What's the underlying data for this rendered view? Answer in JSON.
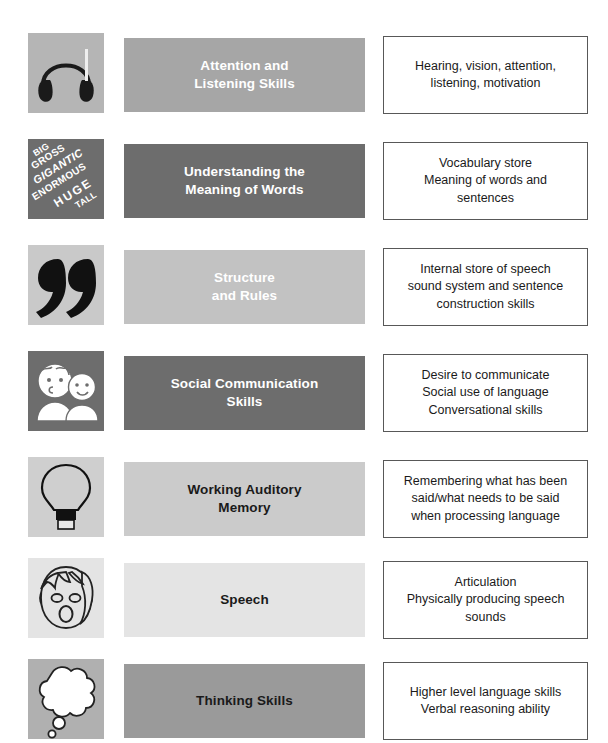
{
  "page": {
    "background_color": "#ffffff"
  },
  "palette": {
    "band_medium_gray": "#a6a6a6",
    "band_dark_gray": "#6d6d6d",
    "band_light_gray": "#c4c4c4",
    "band_lighter_gray": "#cfcfcf",
    "band_very_light_gray": "#e4e4e4",
    "band_mid_gray": "#9a9a9a",
    "icon_tile_light": "#cfcfcf",
    "icon_tile_dark": "#6d6d6d",
    "icon_tile_pale": "#e2e2e2",
    "box_border": "#585858",
    "text_white": "#ffffff",
    "text_dark": "#1a1a1a"
  },
  "rows": [
    {
      "id": "attention-listening",
      "icon_name": "headphones-icon",
      "icon_tile_color": "#b5b5b5",
      "band_color": "#a6a6a6",
      "band_text_color": "#ffffff",
      "label": "Attention and\nListening Skills",
      "description": "Hearing, vision, attention,\nlistening, motivation"
    },
    {
      "id": "meaning-of-words",
      "icon_name": "word-cloud-icon",
      "icon_tile_color": "#6d6d6d",
      "band_color": "#6d6d6d",
      "band_text_color": "#ffffff",
      "label": "Understanding the\nMeaning of Words",
      "description": "Vocabulary store\nMeaning of words and\nsentences",
      "icon_words": [
        "BIG",
        "GROSS",
        "GIGANTIC",
        "ENORMOUS",
        "HUGE",
        "TALL"
      ]
    },
    {
      "id": "structure-and-rules",
      "icon_name": "quotation-marks-icon",
      "icon_tile_color": "#c9c9c9",
      "band_color": "#c2c2c2",
      "band_text_color": "#ffffff",
      "label": "Structure\nand Rules",
      "description": "Internal store of speech\nsound system and sentence\nconstruction skills"
    },
    {
      "id": "social-communication",
      "icon_name": "two-people-icon",
      "icon_tile_color": "#6d6d6d",
      "band_color": "#6d6d6d",
      "band_text_color": "#ffffff",
      "label": "Social Communication\nSkills",
      "description": "Desire to communicate\nSocial use of language\nConversational skills"
    },
    {
      "id": "working-auditory-memory",
      "icon_name": "light-bulb-icon",
      "icon_tile_color": "#cfcfcf",
      "band_color": "#cbcbcb",
      "band_text_color": "#1a1a1a",
      "label": "Working Auditory\nMemory",
      "description": "Remembering what has been\nsaid/what needs to be said\nwhen processing language"
    },
    {
      "id": "speech",
      "icon_name": "face-speaking-icon",
      "icon_tile_color": "#e4e4e4",
      "band_color": "#e4e4e4",
      "band_text_color": "#1a1a1a",
      "label": "Speech",
      "description": "Articulation\nPhysically producing speech\nsounds"
    },
    {
      "id": "thinking-skills",
      "icon_name": "thought-cloud-icon",
      "icon_tile_color": "#b0b0b0",
      "band_color": "#9a9a9a",
      "band_text_color": "#1a1a1a",
      "label": "Thinking Skills",
      "description": "Higher level language skills\nVerbal reasoning ability"
    }
  ]
}
